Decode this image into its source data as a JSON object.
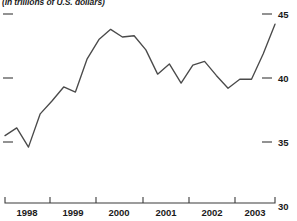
{
  "chart_data": {
    "type": "line",
    "title": "",
    "subtitle": "(In trillions of U.S. dollars)",
    "xlabel": "",
    "ylabel": "",
    "ylim": [
      30,
      45
    ],
    "y_ticks": [
      30,
      35,
      40,
      45
    ],
    "y_tick_labels": [
      "30",
      "35",
      "40",
      "45"
    ],
    "y_axis_position": "right",
    "y_left_ticks_unlabeled": [
      35,
      40,
      45
    ],
    "grid": false,
    "legend": null,
    "x_tick_labels": [
      "1998",
      "1999",
      "2000",
      "2001",
      "2002",
      "2003"
    ],
    "x_range": [
      1997.75,
      2003.5
    ],
    "x": [
      1997.75,
      1998.0,
      1998.25,
      1998.5,
      1998.75,
      1999.0,
      1999.25,
      1999.5,
      1999.75,
      2000.0,
      2000.25,
      2000.5,
      2000.75,
      2001.0,
      2001.25,
      2001.5,
      2001.75,
      2002.0,
      2002.25,
      2002.5,
      2002.75,
      2003.0,
      2003.25,
      2003.5
    ],
    "values": [
      35.5,
      36.1,
      34.6,
      37.2,
      38.2,
      39.3,
      38.9,
      41.5,
      43.0,
      43.8,
      43.2,
      43.3,
      42.2,
      40.3,
      41.1,
      39.6,
      41.0,
      41.3,
      40.2,
      39.2,
      39.9,
      39.9,
      41.9,
      44.2
    ],
    "series": [
      {
        "name": "value",
        "color": "#4a4a4a",
        "values": [
          35.5,
          36.1,
          34.6,
          37.2,
          38.2,
          39.3,
          38.9,
          41.5,
          43.0,
          43.8,
          43.2,
          43.3,
          42.2,
          40.3,
          41.1,
          39.6,
          41.0,
          41.3,
          40.2,
          39.2,
          39.9,
          39.9,
          41.9,
          44.2
        ]
      }
    ]
  },
  "colors": {
    "line": "#4a4a4a",
    "axis": "#3a3a3a",
    "text": "#1a1a1a",
    "background": "#ffffff"
  }
}
